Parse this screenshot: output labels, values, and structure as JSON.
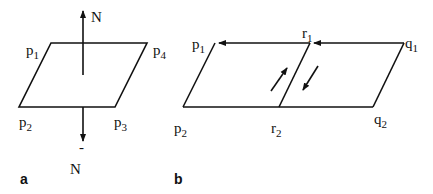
{
  "figure_a": {
    "panel_label": "a",
    "vertices": [
      {
        "name": "p",
        "sub": "1"
      },
      {
        "name": "p",
        "sub": "2"
      },
      {
        "name": "p",
        "sub": "3"
      },
      {
        "name": "p",
        "sub": "4"
      }
    ],
    "normal_up": "N",
    "normal_down_bar": "-",
    "normal_down": "N"
  },
  "figure_b": {
    "panel_label": "b",
    "vertices": [
      {
        "name": "p",
        "sub": "1"
      },
      {
        "name": "r",
        "sub": "1"
      },
      {
        "name": "q",
        "sub": "1"
      },
      {
        "name": "p",
        "sub": "2"
      },
      {
        "name": "r",
        "sub": "2"
      },
      {
        "name": "q",
        "sub": "2"
      }
    ]
  },
  "colors": {
    "stroke": "#111111",
    "background": "#ffffff"
  }
}
